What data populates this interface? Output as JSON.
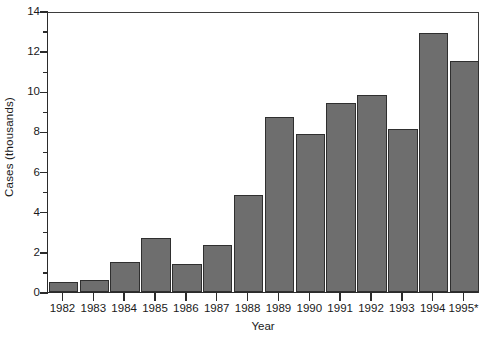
{
  "chart_data": {
    "type": "bar",
    "title": "",
    "subtitle": "",
    "xlabel": "Year",
    "ylabel": "Cases (thousands)",
    "categories": [
      "1982",
      "1983",
      "1984",
      "1985",
      "1986",
      "1987",
      "1988",
      "1989",
      "1990",
      "1991",
      "1992",
      "1993",
      "1994",
      "1995*"
    ],
    "values": [
      0.5,
      0.6,
      1.5,
      2.7,
      1.4,
      2.35,
      4.85,
      8.7,
      7.85,
      9.4,
      9.8,
      8.1,
      12.9,
      11.5
    ],
    "series": [
      {
        "name": "Cases",
        "values": [
          0.5,
          0.6,
          1.5,
          2.7,
          1.4,
          2.35,
          4.85,
          8.7,
          7.85,
          9.4,
          9.8,
          8.1,
          12.9,
          11.5
        ]
      }
    ],
    "ylim": [
      0,
      14
    ],
    "y_major_ticks": [
      0,
      2,
      4,
      6,
      8,
      10,
      12,
      14
    ],
    "y_minor_ticks": [
      1,
      3,
      5,
      7,
      9,
      11,
      13
    ],
    "y_tick_labels": [
      "0",
      "2",
      "4",
      "6",
      "8",
      "10",
      "12",
      "14"
    ],
    "grid": false,
    "legend": false,
    "legend_position": "none",
    "bar_fill_color": "#6e6e6e",
    "bar_border_color": "#2f2f2f",
    "axis_color": "#2b2b2b",
    "background_color": "#ffffff",
    "annotations": [
      "* 1995 value marked with asterisk"
    ]
  }
}
